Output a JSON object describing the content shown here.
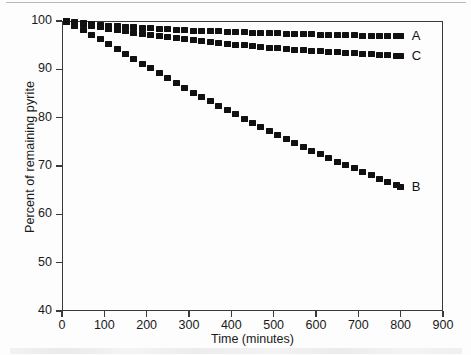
{
  "figure": {
    "background_color": "#fdfdfd",
    "marker_color": "#111111",
    "axis_color": "#3a3a3a"
  },
  "chart_data": {
    "type": "scatter",
    "title": "",
    "xlabel": "Time (minutes)",
    "ylabel": "Percent of remaining pyrite",
    "xlim": [
      0,
      900
    ],
    "ylim": [
      40,
      100
    ],
    "xticks": [
      0,
      100,
      200,
      300,
      400,
      500,
      600,
      700,
      800,
      900
    ],
    "yticks": [
      40,
      50,
      60,
      70,
      80,
      90,
      100
    ],
    "xtick_labels": [
      "0",
      "100",
      "200",
      "300",
      "400",
      "500",
      "600",
      "700",
      "800",
      "900"
    ],
    "ytick_labels": [
      "40",
      "50",
      "60",
      "70",
      "80",
      "90",
      "100"
    ],
    "grid": false,
    "legend": "inline-right-of-series",
    "marker_style": "filled-square",
    "x": [
      10,
      30,
      50,
      70,
      90,
      110,
      130,
      150,
      170,
      190,
      210,
      230,
      250,
      270,
      290,
      310,
      330,
      350,
      370,
      390,
      410,
      430,
      450,
      470,
      490,
      510,
      530,
      550,
      570,
      590,
      610,
      630,
      650,
      670,
      690,
      710,
      730,
      750,
      770,
      790,
      800
    ],
    "series": [
      {
        "name": "A",
        "label": "A",
        "values": [
          99.9,
          99.7,
          99.5,
          99.3,
          99.1,
          99.0,
          98.9,
          98.8,
          98.7,
          98.6,
          98.5,
          98.4,
          98.3,
          98.2,
          98.1,
          98.0,
          97.95,
          97.9,
          97.85,
          97.8,
          97.7,
          97.65,
          97.6,
          97.55,
          97.5,
          97.45,
          97.4,
          97.35,
          97.3,
          97.25,
          97.2,
          97.15,
          97.1,
          97.1,
          97.05,
          97.0,
          97.0,
          96.95,
          96.9,
          96.9,
          96.9
        ]
      },
      {
        "name": "C",
        "label": "C",
        "values": [
          99.9,
          99.6,
          99.3,
          99.0,
          98.7,
          98.4,
          98.1,
          97.85,
          97.6,
          97.35,
          97.1,
          96.9,
          96.7,
          96.5,
          96.3,
          96.1,
          95.9,
          95.7,
          95.5,
          95.3,
          95.1,
          94.95,
          94.8,
          94.65,
          94.5,
          94.35,
          94.2,
          94.05,
          93.9,
          93.8,
          93.7,
          93.6,
          93.5,
          93.4,
          93.3,
          93.2,
          93.1,
          93.0,
          92.9,
          92.85,
          92.8
        ]
      },
      {
        "name": "B",
        "label": "B",
        "values": [
          99.8,
          99.0,
          98.2,
          97.2,
          96.2,
          95.2,
          94.2,
          93.2,
          92.2,
          91.2,
          90.2,
          89.2,
          88.2,
          87.2,
          86.2,
          85.2,
          84.3,
          83.4,
          82.5,
          81.6,
          80.7,
          79.8,
          78.9,
          78.0,
          77.2,
          76.4,
          75.6,
          74.8,
          74.0,
          73.2,
          72.4,
          71.6,
          70.9,
          70.2,
          69.5,
          68.8,
          68.1,
          67.4,
          66.7,
          66.0,
          65.6
        ]
      }
    ]
  }
}
